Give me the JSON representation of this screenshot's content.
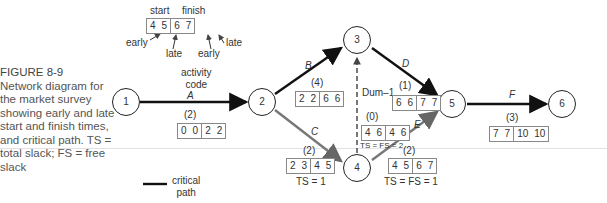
{
  "caption": {
    "title": "FIGURE 8-9",
    "text": "Network diagram for the market survey showing early and late start and finish times, and critical path. TS = total slack; FS = free slack"
  },
  "legend_key": {
    "start": "start",
    "finish": "finish",
    "values": [
      "4",
      "5",
      "6",
      "7"
    ],
    "early1": "early",
    "late1": "late",
    "early2": "early",
    "late2": "late"
  },
  "activity_code_label": "activity\ncode",
  "critical_path_label": "critical\npath",
  "colors": {
    "critical": "#111111",
    "noncritical": "#777777",
    "dummy": "#333333"
  },
  "nodes": [
    {
      "id": "1"
    },
    {
      "id": "2"
    },
    {
      "id": "3"
    },
    {
      "id": "4"
    },
    {
      "id": "5"
    },
    {
      "id": "6"
    }
  ],
  "activities": [
    {
      "code": "A",
      "from": "1",
      "to": "2",
      "duration": "(2)",
      "es": "0",
      "ls": "0",
      "ef": "2",
      "lf": "2",
      "critical": true,
      "slack": ""
    },
    {
      "code": "B",
      "from": "2",
      "to": "3",
      "duration": "(4)",
      "es": "2",
      "ls": "2",
      "ef": "6",
      "lf": "6",
      "critical": true,
      "slack": ""
    },
    {
      "code": "C",
      "from": "2",
      "to": "4",
      "duration": "(2)",
      "es": "2",
      "ls": "3",
      "ef": "4",
      "lf": "5",
      "critical": false,
      "slack": "TS = 1"
    },
    {
      "code": "Dum–1",
      "from": "4",
      "to": "3",
      "duration": "(0)",
      "es": "4",
      "ls": "6",
      "ef": "4",
      "lf": "6",
      "critical": false,
      "slack": "TS = FS = 2"
    },
    {
      "code": "D",
      "from": "3",
      "to": "5",
      "duration": "(1)",
      "es": "6",
      "ls": "6",
      "ef": "7",
      "lf": "7",
      "critical": true,
      "slack": ""
    },
    {
      "code": "E",
      "from": "4",
      "to": "5",
      "duration": "(2)",
      "es": "4",
      "ls": "5",
      "ef": "6",
      "lf": "7",
      "critical": false,
      "slack": "TS = FS = 1"
    },
    {
      "code": "F",
      "from": "5",
      "to": "6",
      "duration": "(3)",
      "es": "7",
      "ls": "7",
      "ef": "10",
      "lf": "10",
      "critical": true,
      "slack": ""
    }
  ]
}
